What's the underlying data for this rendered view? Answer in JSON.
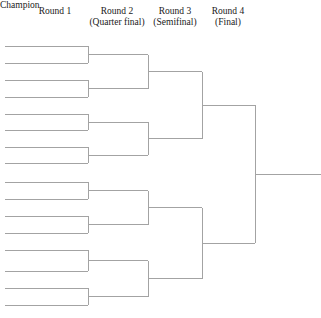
{
  "canvas": {
    "width": 321,
    "height": 318,
    "background": "#ffffff"
  },
  "style": {
    "line_color": "#a3a3a3",
    "line_width": 1,
    "text_color": "#1a1a1a"
  },
  "headers": [
    {
      "name": "round-1",
      "line1": "Round 1",
      "line2": "",
      "cx": 55,
      "top": 6
    },
    {
      "name": "round-2",
      "line1": "Round 2",
      "line2": "(Quarter final)",
      "cx": 117,
      "top": 6
    },
    {
      "name": "round-3",
      "line1": "Round 3",
      "line2": "(Semifinal)",
      "cx": 175,
      "top": 6
    },
    {
      "name": "round-4",
      "line1": "Round 4",
      "line2": "(Final)",
      "cx": 228,
      "top": 6
    }
  ],
  "champion": {
    "label": "Champion",
    "x": 259,
    "y": 179
  },
  "bracket": {
    "rounds": [
      {
        "round": 1,
        "x_start": 5,
        "x_end": 88,
        "slots": 16,
        "y": [
          46,
          63,
          80,
          97,
          114,
          130,
          147,
          163,
          182,
          199,
          216,
          233,
          250,
          271,
          288,
          305
        ]
      },
      {
        "round": 2,
        "x_start": 88,
        "x_end": 148,
        "slots": 8,
        "y": [
          54.5,
          88.5,
          122,
          155,
          190.5,
          224.5,
          260.5,
          296.5
        ]
      },
      {
        "round": 3,
        "x_start": 148,
        "x_end": 202,
        "slots": 4,
        "y": [
          71.5,
          138.5,
          207.5,
          278.5
        ]
      },
      {
        "round": 4,
        "x_start": 202,
        "x_end": 255,
        "slots": 2,
        "y": [
          105,
          243
        ]
      },
      {
        "round": 5,
        "x_start": 255,
        "x_end": 321,
        "slots": 1,
        "y": [
          174
        ]
      }
    ]
  }
}
